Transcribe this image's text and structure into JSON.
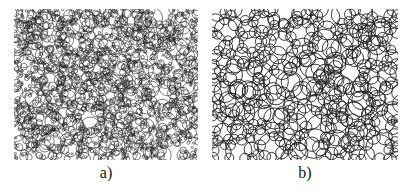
{
  "figure": {
    "background_color": "#ffffff",
    "ink_color": "#1a1a1a",
    "panel_count": 2,
    "panels": [
      {
        "id": "a",
        "caption": "a)",
        "description": "dense polydisperse circle packing, many small circles with scattered large circular voids",
        "x": 14,
        "y": 9,
        "width": 184,
        "height": 151,
        "circle_count": 1500,
        "radius_min": 1.1,
        "radius_max": 11.0,
        "line_width": 0.55,
        "void_count": 22,
        "seed": 1337
      },
      {
        "id": "b",
        "caption": "b)",
        "description": "coarse circle packing, larger more uniform overlapping circles with open interstitial pores",
        "x": 212,
        "y": 9,
        "width": 186,
        "height": 151,
        "circle_count": 330,
        "radius_min": 4.5,
        "radius_max": 15.0,
        "line_width": 0.85,
        "void_count": 14,
        "seed": 20481
      }
    ]
  },
  "chart_data": {
    "type": "scatter",
    "title": "",
    "xlabel": "",
    "ylabel": "",
    "subplot_labels": [
      "a)",
      "b)"
    ],
    "series": [
      {
        "name": "a)",
        "rendering": "circle-outlines",
        "n_circles": 1500,
        "radius_range": [
          1.1,
          11.0
        ],
        "mean_radius": 2.9,
        "packing": "dense polydisperse",
        "domain": [
          0,
          184
        ],
        "range": [
          0,
          151
        ]
      },
      {
        "name": "b)",
        "rendering": "circle-outlines",
        "n_circles": 330,
        "radius_range": [
          4.5,
          15.0
        ],
        "mean_radius": 8.4,
        "packing": "coarse near-uniform",
        "domain": [
          0,
          186
        ],
        "range": [
          0,
          151
        ]
      }
    ],
    "legend_position": "none",
    "grid": false
  }
}
